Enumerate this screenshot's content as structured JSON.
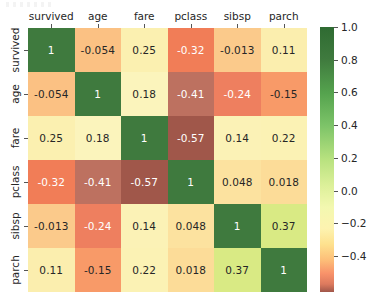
{
  "chart_data": {
    "type": "heatmap",
    "title": "",
    "xlabel": "",
    "ylabel": "",
    "colormap": "RdYlGn",
    "grid": false,
    "legend_position": "right",
    "annotated": true,
    "categories": [
      "survived",
      "age",
      "fare",
      "pclass",
      "sibsp",
      "parch"
    ],
    "x_tick_labels": [
      "survived",
      "age",
      "fare",
      "pclass",
      "sibsp",
      "parch"
    ],
    "y_tick_labels": [
      "survived",
      "age",
      "fare",
      "pclass",
      "sibsp",
      "parch"
    ],
    "rows": [
      {
        "label": "survived",
        "values": [
          1,
          -0.054,
          0.25,
          -0.32,
          -0.013,
          0.11
        ],
        "text": [
          "1",
          "-0.054",
          "0.25",
          "-0.32",
          "-0.013",
          "0.11"
        ],
        "colors": [
          "#3f7a3e",
          "#fbc183",
          "#fbf0b0",
          "#f17d57",
          "#fbca8b",
          "#fbeeae"
        ],
        "text_colors": [
          "#ffffff",
          "#262626",
          "#262626",
          "#ffffff",
          "#262626",
          "#262626"
        ]
      },
      {
        "label": "age",
        "values": [
          -0.054,
          1,
          0.18,
          -0.41,
          -0.24,
          -0.15
        ],
        "text": [
          "-0.054",
          "1",
          "0.18",
          "-0.41",
          "-0.24",
          "-0.15"
        ],
        "colors": [
          "#fbc183",
          "#3f7a3e",
          "#fbf4bc",
          "#bd7160",
          "#ee7f5f",
          "#f89a68"
        ],
        "text_colors": [
          "#262626",
          "#ffffff",
          "#262626",
          "#ffffff",
          "#ffffff",
          "#262626"
        ]
      },
      {
        "label": "fare",
        "values": [
          0.25,
          0.18,
          1,
          -0.57,
          0.14,
          0.22
        ],
        "text": [
          "0.25",
          "0.18",
          "1",
          "-0.57",
          "0.14",
          "0.22"
        ],
        "colors": [
          "#fbf0b0",
          "#fbf4bc",
          "#3f7a3e",
          "#a0574a",
          "#fbf2b6",
          "#fbf2b4"
        ],
        "text_colors": [
          "#262626",
          "#262626",
          "#ffffff",
          "#ffffff",
          "#262626",
          "#262626"
        ]
      },
      {
        "label": "pclass",
        "values": [
          -0.32,
          -0.41,
          -0.57,
          1,
          0.048,
          0.018
        ],
        "text": [
          "-0.32",
          "-0.41",
          "-0.57",
          "1",
          "0.048",
          "0.018"
        ],
        "colors": [
          "#f17d57",
          "#bd7160",
          "#a0574a",
          "#3f7a3e",
          "#fce29f",
          "#fcdc98"
        ],
        "text_colors": [
          "#ffffff",
          "#ffffff",
          "#ffffff",
          "#ffffff",
          "#262626",
          "#262626"
        ]
      },
      {
        "label": "sibsp",
        "values": [
          -0.013,
          -0.24,
          0.14,
          0.048,
          1,
          0.37
        ],
        "text": [
          "-0.013",
          "-0.24",
          "0.14",
          "0.048",
          "1",
          "0.37"
        ],
        "colors": [
          "#fbca8b",
          "#ee7f5f",
          "#fbf2b6",
          "#fce29f",
          "#3f7a3e",
          "#d9ea84"
        ],
        "text_colors": [
          "#262626",
          "#ffffff",
          "#262626",
          "#262626",
          "#ffffff",
          "#262626"
        ]
      },
      {
        "label": "parch",
        "values": [
          0.11,
          -0.15,
          0.22,
          0.018,
          0.37,
          1
        ],
        "text": [
          "0.11",
          "-0.15",
          "0.22",
          "0.018",
          "0.37",
          "1"
        ],
        "colors": [
          "#fbeeae",
          "#f89a68",
          "#fbf2b4",
          "#fcdc98",
          "#d9ea84",
          "#3f7a3e"
        ],
        "text_colors": [
          "#262626",
          "#262626",
          "#262626",
          "#262626",
          "#262626",
          "#ffffff"
        ]
      }
    ],
    "colorbar": {
      "vmin": -0.62,
      "vmax": 1.0,
      "ticks": [
        1.0,
        0.8,
        0.6,
        0.4,
        0.2,
        0.0,
        -0.2,
        -0.4
      ],
      "tick_labels": [
        "1.0",
        "0.8",
        "0.6",
        "0.4",
        "0.2",
        "0.0",
        "−0.2",
        "−0.4"
      ],
      "gradient_stops": [
        {
          "pos": 0,
          "color": "#2f6b32"
        },
        {
          "pos": 12,
          "color": "#3f7a3e"
        },
        {
          "pos": 25,
          "color": "#55a34e"
        },
        {
          "pos": 37,
          "color": "#7cc368"
        },
        {
          "pos": 50,
          "color": "#b8e27f"
        },
        {
          "pos": 60,
          "color": "#ddf09a"
        },
        {
          "pos": 68,
          "color": "#f3f8b0"
        },
        {
          "pos": 76,
          "color": "#fdf3b0"
        },
        {
          "pos": 82,
          "color": "#fee18e"
        },
        {
          "pos": 88,
          "color": "#fdbe78"
        },
        {
          "pos": 93,
          "color": "#f8926a"
        },
        {
          "pos": 97,
          "color": "#dd7a5e"
        },
        {
          "pos": 100,
          "color": "#a0574a"
        }
      ]
    }
  }
}
